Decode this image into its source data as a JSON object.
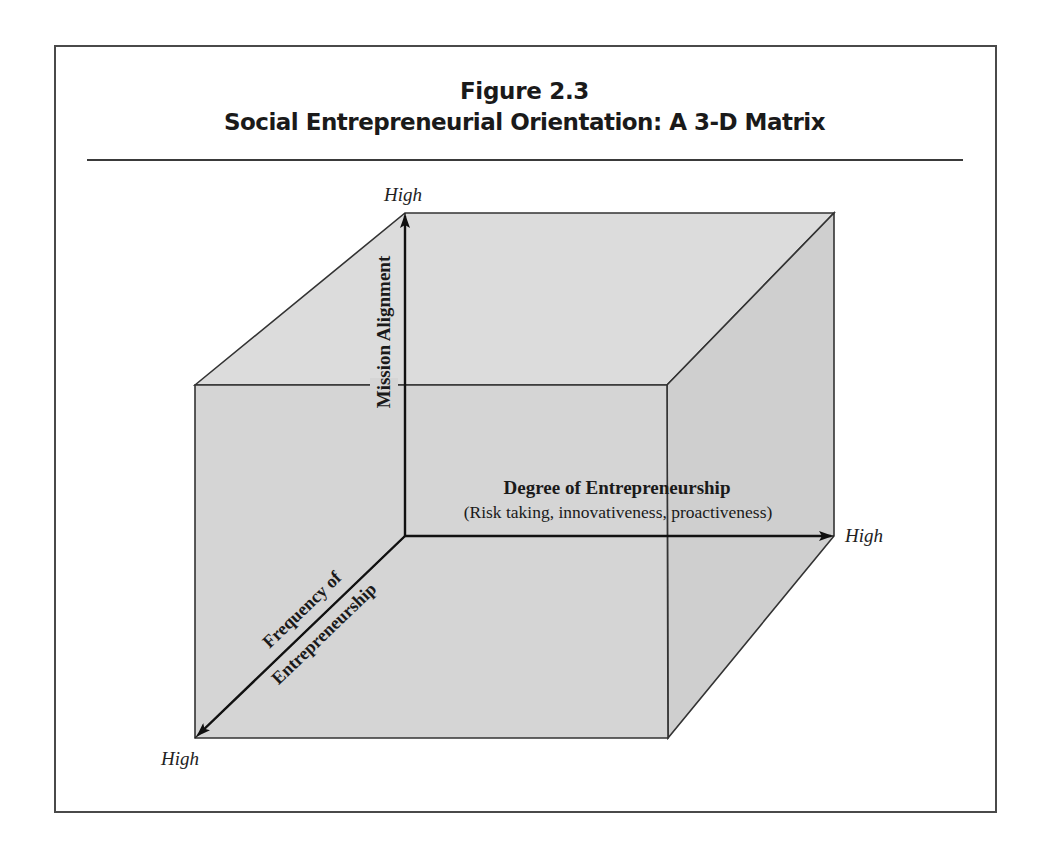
{
  "figure": {
    "number": "Figure 2.3",
    "title": "Social Entrepreneurial Orientation: A 3-D Matrix"
  },
  "axes": {
    "vertical": {
      "label": "Mission Alignment",
      "end_label": "High"
    },
    "horizontal": {
      "label": "Degree of Entrepreneurship",
      "sublabel": "(Risk taking, innovativeness, proactiveness)",
      "end_label": "High"
    },
    "depth": {
      "label_line1": "Frequency of",
      "label_line2": "Entrepreneurship",
      "end_label": "High"
    }
  },
  "colors": {
    "frame": "#4a4a4a",
    "cube_front": "#d5d5d5",
    "cube_top": "#dcdcdc",
    "cube_right": "#cfcfcf",
    "cube_edge": "#333333",
    "axis": "#111111"
  }
}
